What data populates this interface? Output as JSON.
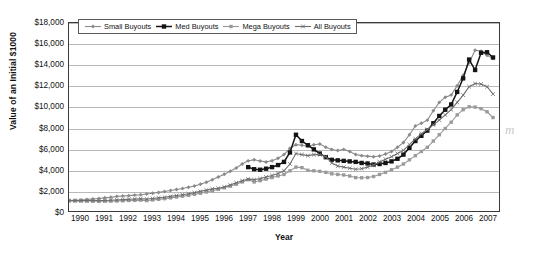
{
  "chart_data": {
    "type": "line",
    "title": "",
    "xlabel": "Year",
    "ylabel": "Value of an Initial $1000",
    "ylim": [
      0,
      18000
    ],
    "ytick_labels": [
      "$18,000",
      "$16,000",
      "$14,000",
      "$12,000",
      "$10,000",
      "$8,000",
      "$6,000",
      "$4,000",
      "$2,000",
      "$0"
    ],
    "ytick_values": [
      18000,
      16000,
      14000,
      12000,
      10000,
      8000,
      6000,
      4000,
      2000,
      0
    ],
    "xtick_labels": [
      "1990",
      "1991",
      "1992",
      "1993",
      "1994",
      "1995",
      "1996",
      "1997",
      "1998",
      "1999",
      "2000",
      "2001",
      "2002",
      "2003",
      "2004",
      "2005",
      "2006",
      "2007"
    ],
    "xlim": [
      1990,
      2008
    ],
    "grid": "horizontal",
    "legend_position": "top-left-inside",
    "x": [
      1990.0,
      1990.25,
      1990.5,
      1990.75,
      1991.0,
      1991.25,
      1991.5,
      1991.75,
      1992.0,
      1992.25,
      1992.5,
      1992.75,
      1993.0,
      1993.25,
      1993.5,
      1993.75,
      1994.0,
      1994.25,
      1994.5,
      1994.75,
      1995.0,
      1995.25,
      1995.5,
      1995.75,
      1996.0,
      1996.25,
      1996.5,
      1996.75,
      1997.0,
      1997.25,
      1997.5,
      1997.75,
      1998.0,
      1998.25,
      1998.5,
      1998.75,
      1999.0,
      1999.25,
      1999.5,
      1999.75,
      2000.0,
      2000.25,
      2000.5,
      2000.75,
      2001.0,
      2001.25,
      2001.5,
      2001.75,
      2002.0,
      2002.25,
      2002.5,
      2002.75,
      2003.0,
      2003.25,
      2003.5,
      2003.75,
      2004.0,
      2004.25,
      2004.5,
      2004.75,
      2005.0,
      2005.25,
      2005.5,
      2005.75,
      2006.0,
      2006.25,
      2006.5,
      2006.75,
      2007.0,
      2007.25,
      2007.5,
      2007.75
    ],
    "series": [
      {
        "name": "Small Buyouts",
        "marker": "diamond",
        "color": "#8a8a8a",
        "values": [
          1000,
          1030,
          1060,
          1100,
          1150,
          1200,
          1260,
          1320,
          1400,
          1440,
          1470,
          1520,
          1560,
          1620,
          1700,
          1780,
          1870,
          1960,
          2060,
          2160,
          2270,
          2400,
          2560,
          2760,
          2990,
          3250,
          3520,
          3800,
          4120,
          4500,
          4800,
          4900,
          4780,
          4700,
          4820,
          5050,
          5400,
          6000,
          6350,
          6300,
          6200,
          6350,
          6420,
          6100,
          5880,
          5800,
          5900,
          5700,
          5400,
          5300,
          5250,
          5200,
          5260,
          5450,
          5700,
          6100,
          6550,
          7300,
          8150,
          8400,
          8700,
          9600,
          10400,
          10900,
          11100,
          12000,
          13000,
          14200,
          15400,
          15300,
          14900,
          14600
        ]
      },
      {
        "name": "Med Buyouts",
        "marker": "square-filled",
        "color": "#141414",
        "values": [
          null,
          null,
          null,
          null,
          null,
          null,
          null,
          null,
          null,
          null,
          null,
          null,
          null,
          null,
          null,
          null,
          null,
          null,
          null,
          null,
          null,
          null,
          null,
          null,
          null,
          null,
          null,
          null,
          null,
          null,
          4200,
          4000,
          3950,
          4050,
          4200,
          4400,
          4700,
          5600,
          7300,
          6700,
          6300,
          5900,
          5500,
          5150,
          4900,
          4850,
          4800,
          4750,
          4700,
          4600,
          4550,
          4450,
          4500,
          4600,
          4750,
          5000,
          5400,
          6050,
          6700,
          7200,
          7700,
          8400,
          9100,
          9700,
          10200,
          11400,
          12700,
          14500,
          13500,
          15150,
          15200,
          14700
        ]
      },
      {
        "name": "Mega Buyouts",
        "marker": "square-small",
        "color": "#9a9a9a",
        "values": [
          980,
          970,
          960,
          950,
          940,
          930,
          940,
          950,
          960,
          980,
          1000,
          1020,
          1040,
          1000,
          1060,
          1120,
          1180,
          1260,
          1340,
          1420,
          1500,
          1600,
          1700,
          1820,
          1940,
          2080,
          2220,
          2380,
          2560,
          2780,
          3000,
          2780,
          2900,
          3050,
          3200,
          3350,
          3500,
          3850,
          4200,
          4150,
          3900,
          3850,
          3800,
          3700,
          3560,
          3500,
          3450,
          3350,
          3200,
          3180,
          3200,
          3300,
          3500,
          3700,
          3950,
          4200,
          4500,
          4900,
          5300,
          5700,
          6100,
          6700,
          7300,
          7900,
          8500,
          9200,
          9700,
          9980,
          9950,
          9800,
          9500,
          8950
        ]
      },
      {
        "name": "All Buyouts",
        "marker": "x",
        "color": "#6e6e6e",
        "values": [
          990,
          990,
          995,
          1000,
          1000,
          1000,
          1010,
          1030,
          1060,
          1090,
          1120,
          1150,
          1180,
          1150,
          1200,
          1260,
          1320,
          1400,
          1480,
          1560,
          1650,
          1760,
          1880,
          2000,
          2120,
          2180,
          2300,
          2480,
          2700,
          2900,
          3050,
          3000,
          3100,
          3250,
          3400,
          3600,
          3850,
          4500,
          5500,
          5400,
          5300,
          5400,
          5400,
          5200,
          4600,
          4300,
          4200,
          4100,
          4000,
          4050,
          4200,
          4400,
          4700,
          4950,
          5200,
          5500,
          5800,
          6350,
          6900,
          7400,
          7800,
          8250,
          8700,
          9200,
          9700,
          10400,
          11100,
          11900,
          12200,
          12150,
          11900,
          11200
        ]
      }
    ]
  },
  "legend": {
    "items": [
      {
        "label": "Small Buyouts"
      },
      {
        "label": "Med Buyouts"
      },
      {
        "label": "Mega Buyouts"
      },
      {
        "label": "All Buyouts"
      }
    ]
  },
  "artifact": {
    "mark": "m"
  }
}
